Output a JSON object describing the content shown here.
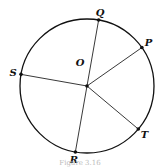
{
  "diagram": {
    "type": "circle-with-radii",
    "center_label": "O",
    "points": [
      {
        "label": "Q",
        "angle_deg": 80
      },
      {
        "label": "P",
        "angle_deg": 35
      },
      {
        "label": "S",
        "angle_deg": 170
      },
      {
        "label": "R",
        "angle_deg": 260
      },
      {
        "label": "T",
        "angle_deg": 320
      }
    ],
    "segments": [
      [
        "Q",
        "R"
      ],
      [
        "S",
        "O"
      ],
      [
        "O",
        "P"
      ],
      [
        "O",
        "T"
      ]
    ],
    "caption": "Figure 3.16"
  }
}
